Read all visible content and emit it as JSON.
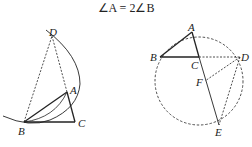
{
  "title": "∠A = 2∠B",
  "figure_left": {
    "points": {
      "A": {
        "label": "A",
        "x": 67,
        "y": 92
      },
      "B": {
        "label": "B",
        "x": 24,
        "y": 122
      },
      "C": {
        "label": "C",
        "x": 75,
        "y": 122
      },
      "D": {
        "label": "D",
        "x": 52,
        "y": 36
      }
    },
    "solid_segments": [
      "AB",
      "BC",
      "CA"
    ],
    "dashed_segments": [
      "BD",
      "DA"
    ],
    "arcs": [
      "arc centered near A through B and D",
      "arc B to A (inner)"
    ]
  },
  "figure_right": {
    "points": {
      "A": {
        "label": "A",
        "x": 192,
        "y": 32
      },
      "B": {
        "label": "B",
        "x": 160,
        "y": 57
      },
      "C": {
        "label": "C",
        "x": 199,
        "y": 57
      },
      "D": {
        "label": "D",
        "x": 240,
        "y": 57
      },
      "E": {
        "label": "E",
        "x": 219,
        "y": 125
      },
      "F": {
        "label": "F",
        "x": 205,
        "y": 81
      }
    },
    "circle": {
      "cx": 199,
      "cy": 81,
      "r": 44,
      "style": "dashed"
    },
    "solid_segments": [
      "AB",
      "BC",
      "AC",
      "CE"
    ],
    "dashed_segments": [
      "CD",
      "DE",
      "DF"
    ]
  },
  "colors": {
    "ink": "#222222",
    "background": "#ffffff"
  }
}
